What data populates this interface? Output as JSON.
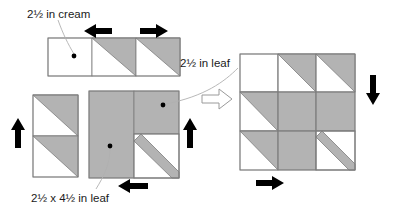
{
  "figure": {
    "background_color": "#ffffff",
    "fabric_leaf_color": "#b3b3b3",
    "fabric_cream_color": "#ffffff",
    "outline_color": "#808080",
    "arrow_color": "#000000",
    "leader_color": "#a9a9a9"
  },
  "labels": {
    "cream_square": "2½ in cream",
    "leaf_square": "2½ in leaf",
    "leaf_rectangle": "2½ x 4½ in leaf"
  },
  "arrows": {
    "top_left": {
      "name": "press-left-arrow",
      "direction": "left"
    },
    "top_right": {
      "name": "press-right-arrow",
      "direction": "right"
    },
    "left_up": {
      "name": "press-up-arrow",
      "direction": "up"
    },
    "mid_up": {
      "name": "press-up-arrow",
      "direction": "up"
    },
    "bottom_left_in": {
      "name": "press-left-arrow",
      "direction": "left"
    },
    "result_down": {
      "name": "press-down-arrow",
      "direction": "down"
    },
    "result_right": {
      "name": "press-right-arrow",
      "direction": "right"
    },
    "transition": {
      "name": "assembly-arrow",
      "direction": "right"
    }
  },
  "units": {
    "top_strip": {
      "name": "top-strip-unit",
      "cells": [
        "cream-square",
        "half-square-triangle",
        "half-square-triangle"
      ]
    },
    "left_column": {
      "name": "left-column-unit",
      "cells": [
        "half-square-triangle",
        "half-square-triangle"
      ]
    },
    "center_unit": {
      "name": "center-unit",
      "cells": [
        "leaf-rectangle",
        "leaf-square",
        "leaf-stripe-square"
      ]
    },
    "result_block": {
      "name": "finished-block",
      "rows": 3,
      "columns": 3
    }
  }
}
